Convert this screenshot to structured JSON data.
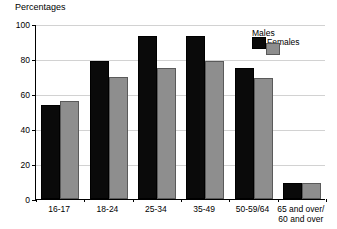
{
  "chart_data": {
    "type": "bar",
    "title": "Percentages",
    "xlabel": "",
    "ylabel": "",
    "ylim": [
      0,
      100
    ],
    "yticks": [
      0,
      20,
      40,
      60,
      80,
      100
    ],
    "grid": true,
    "legend_position": "top-right",
    "categories": [
      "16-17",
      "18-24",
      "25-34",
      "35-49",
      "50-59/64",
      "65 and over/\n60 and over"
    ],
    "series": [
      {
        "name": "Males",
        "color": "#0a0a0a",
        "values": [
          54,
          79,
          93,
          93,
          75,
          9
        ]
      },
      {
        "name": "Females",
        "color": "#8e8e8e",
        "values": [
          56,
          70,
          75,
          79,
          69,
          9
        ]
      }
    ]
  },
  "legend": {
    "males_label": "Males",
    "females_label": "Females"
  }
}
